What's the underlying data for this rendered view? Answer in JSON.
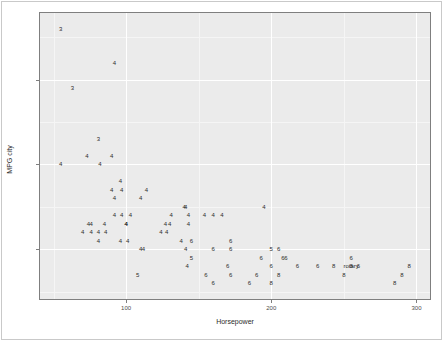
{
  "chart_data": {
    "type": "scatter",
    "title": "",
    "xlabel": "Horsepower",
    "ylabel": "MPG city",
    "xlim": [
      40,
      310
    ],
    "ylim": [
      14,
      48
    ],
    "xticks": [
      100,
      200,
      300
    ],
    "yticks": [
      20,
      30,
      40
    ],
    "xtick_labels": [
      "100",
      "200",
      "300"
    ],
    "ytick_labels": [
      "20",
      "30",
      "40"
    ],
    "grid": true,
    "legend": "none",
    "marker_encoding": "text glyph = number of cylinders",
    "marker_labels": [
      "3",
      "4",
      "5",
      "6",
      "8",
      "rotary"
    ],
    "points": [
      {
        "x": 55,
        "y": 46,
        "label": "3"
      },
      {
        "x": 92,
        "y": 42,
        "label": "4"
      },
      {
        "x": 63,
        "y": 39,
        "label": "3"
      },
      {
        "x": 81,
        "y": 33,
        "label": "3"
      },
      {
        "x": 73,
        "y": 31,
        "label": "4"
      },
      {
        "x": 90,
        "y": 31,
        "label": "4"
      },
      {
        "x": 55,
        "y": 30,
        "label": "4"
      },
      {
        "x": 82,
        "y": 30,
        "label": "4"
      },
      {
        "x": 96,
        "y": 28,
        "label": "4"
      },
      {
        "x": 90,
        "y": 27,
        "label": "4"
      },
      {
        "x": 97,
        "y": 27,
        "label": "4"
      },
      {
        "x": 92,
        "y": 26,
        "label": "4"
      },
      {
        "x": 114,
        "y": 27,
        "label": "4"
      },
      {
        "x": 110,
        "y": 26,
        "label": "4"
      },
      {
        "x": 103,
        "y": 24,
        "label": "4"
      },
      {
        "x": 92,
        "y": 24,
        "label": "4"
      },
      {
        "x": 97,
        "y": 24,
        "label": "4"
      },
      {
        "x": 131,
        "y": 24,
        "label": "4"
      },
      {
        "x": 100,
        "y": 23,
        "label": "4"
      },
      {
        "x": 140,
        "y": 25,
        "label": "4"
      },
      {
        "x": 141,
        "y": 25,
        "label": "4"
      },
      {
        "x": 143,
        "y": 24,
        "label": "4"
      },
      {
        "x": 154,
        "y": 24,
        "label": "4"
      },
      {
        "x": 160,
        "y": 24,
        "label": "4"
      },
      {
        "x": 166,
        "y": 24,
        "label": "4"
      },
      {
        "x": 143,
        "y": 23,
        "label": "4"
      },
      {
        "x": 74,
        "y": 23,
        "label": "4"
      },
      {
        "x": 76,
        "y": 23,
        "label": "4"
      },
      {
        "x": 85,
        "y": 23,
        "label": "4"
      },
      {
        "x": 100,
        "y": 23,
        "label": "4"
      },
      {
        "x": 127,
        "y": 23,
        "label": "4"
      },
      {
        "x": 130,
        "y": 23,
        "label": "4"
      },
      {
        "x": 70,
        "y": 22,
        "label": "4"
      },
      {
        "x": 76,
        "y": 22,
        "label": "4"
      },
      {
        "x": 81,
        "y": 22,
        "label": "4"
      },
      {
        "x": 86,
        "y": 22,
        "label": "4"
      },
      {
        "x": 124,
        "y": 22,
        "label": "4"
      },
      {
        "x": 128,
        "y": 22,
        "label": "4"
      },
      {
        "x": 81,
        "y": 21,
        "label": "4"
      },
      {
        "x": 96,
        "y": 21,
        "label": "4"
      },
      {
        "x": 101,
        "y": 21,
        "label": "4"
      },
      {
        "x": 195,
        "y": 25,
        "label": "4"
      },
      {
        "x": 138,
        "y": 21,
        "label": "4"
      },
      {
        "x": 145,
        "y": 21,
        "label": "6"
      },
      {
        "x": 172,
        "y": 21,
        "label": "6"
      },
      {
        "x": 110,
        "y": 20,
        "label": "4"
      },
      {
        "x": 112,
        "y": 20,
        "label": "4"
      },
      {
        "x": 141,
        "y": 20,
        "label": "4"
      },
      {
        "x": 160,
        "y": 20,
        "label": "6"
      },
      {
        "x": 172,
        "y": 20,
        "label": "6"
      },
      {
        "x": 200,
        "y": 20,
        "label": "5"
      },
      {
        "x": 205,
        "y": 20,
        "label": "6"
      },
      {
        "x": 145,
        "y": 19,
        "label": "5"
      },
      {
        "x": 193,
        "y": 19,
        "label": "6"
      },
      {
        "x": 208,
        "y": 19,
        "label": "6"
      },
      {
        "x": 210,
        "y": 19,
        "label": "6"
      },
      {
        "x": 255,
        "y": 19,
        "label": "6"
      },
      {
        "x": 142,
        "y": 18,
        "label": "4"
      },
      {
        "x": 170,
        "y": 18,
        "label": "6"
      },
      {
        "x": 200,
        "y": 18,
        "label": "6"
      },
      {
        "x": 218,
        "y": 18,
        "label": "6"
      },
      {
        "x": 232,
        "y": 18,
        "label": "6"
      },
      {
        "x": 243,
        "y": 18,
        "label": "8"
      },
      {
        "x": 255,
        "y": 18,
        "label": "8"
      },
      {
        "x": 260,
        "y": 18,
        "label": "6"
      },
      {
        "x": 295,
        "y": 18,
        "label": "8"
      },
      {
        "x": 108,
        "y": 17,
        "label": "5"
      },
      {
        "x": 155,
        "y": 17,
        "label": "6"
      },
      {
        "x": 172,
        "y": 17,
        "label": "6"
      },
      {
        "x": 190,
        "y": 17,
        "label": "6"
      },
      {
        "x": 205,
        "y": 17,
        "label": "8"
      },
      {
        "x": 250,
        "y": 17,
        "label": "8"
      },
      {
        "x": 290,
        "y": 17,
        "label": "8"
      },
      {
        "x": 160,
        "y": 16,
        "label": "6"
      },
      {
        "x": 185,
        "y": 16,
        "label": "6"
      },
      {
        "x": 200,
        "y": 16,
        "label": "8"
      },
      {
        "x": 285,
        "y": 16,
        "label": "8"
      },
      {
        "x": 255,
        "y": 18,
        "label": "rotary"
      }
    ]
  },
  "axes": {
    "x_title": "Horsepower",
    "y_title": "MPG city"
  },
  "annotations": [
    {
      "text": "rotary",
      "x": 255,
      "y": 18
    }
  ]
}
